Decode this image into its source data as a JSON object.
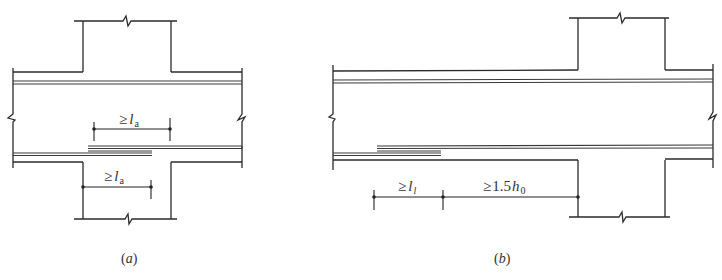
{
  "figure": {
    "panels": [
      {
        "id": "a",
        "caption": "(a)",
        "caption_letter": "a",
        "dimensions": [
          {
            "symbol": "≥",
            "var": "l",
            "subscript": "a",
            "position": "above lap splice"
          },
          {
            "symbol": "≥",
            "var": "l",
            "subscript": "a",
            "position": "below beam, from column face"
          }
        ]
      },
      {
        "id": "b",
        "caption": "(b)",
        "caption_letter": "b",
        "dimensions": [
          {
            "symbol": "≥",
            "var": "l",
            "subscript": "l",
            "position": "lap length"
          },
          {
            "symbol": "≥",
            "prefix": "1.5",
            "var": "h",
            "subscript": "0",
            "position": "distance from lap to column face"
          }
        ]
      }
    ],
    "colors": {
      "line": "#2b2b2b",
      "background": "#ffffff"
    }
  }
}
